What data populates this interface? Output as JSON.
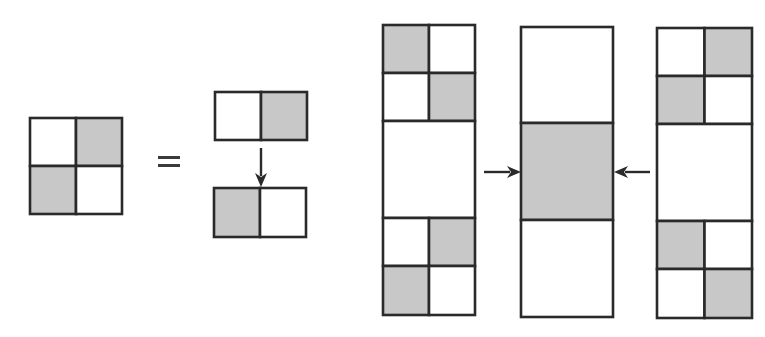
{
  "colors": {
    "shaded": "#c8c8c8",
    "blank": "#ffffff",
    "stroke": "#2a2a2a"
  },
  "figures": [
    {
      "name": "checkerboard-2x2",
      "x": 30,
      "y": 118,
      "cellW": 46,
      "cellH": 48,
      "rows": [
        [
          "blank",
          "shaded"
        ],
        [
          "shaded",
          "blank"
        ]
      ]
    },
    {
      "name": "top-pair",
      "x": 215,
      "y": 92,
      "cellW": 46,
      "cellH": 48,
      "rows": [
        [
          "blank",
          "shaded"
        ]
      ]
    },
    {
      "name": "bottom-pair",
      "x": 214,
      "y": 188,
      "cellW": 46,
      "cellH": 49,
      "rows": [
        [
          "shaded",
          "blank"
        ]
      ]
    },
    {
      "name": "left-column",
      "x": 383,
      "y": 25,
      "width": 92,
      "height": 290,
      "bands": [
        {
          "h": 48,
          "cells": [
            "shaded",
            "blank"
          ]
        },
        {
          "h": 48,
          "cells": [
            "blank",
            "shaded"
          ]
        },
        {
          "h": 97,
          "cells": [
            "blank"
          ]
        },
        {
          "h": 48,
          "cells": [
            "blank",
            "shaded"
          ]
        },
        {
          "h": 49,
          "cells": [
            "shaded",
            "blank"
          ]
        }
      ]
    },
    {
      "name": "middle-column",
      "x": 521,
      "y": 27,
      "width": 92,
      "height": 290,
      "bands": [
        {
          "h": 96,
          "cells": [
            "blank"
          ]
        },
        {
          "h": 97,
          "cells": [
            "shaded"
          ]
        },
        {
          "h": 97,
          "cells": [
            "blank"
          ]
        }
      ]
    },
    {
      "name": "right-column",
      "x": 657,
      "y": 28,
      "width": 95,
      "height": 290,
      "bands": [
        {
          "h": 48,
          "cells": [
            "blank",
            "shaded"
          ]
        },
        {
          "h": 48,
          "cells": [
            "shaded",
            "blank"
          ]
        },
        {
          "h": 97,
          "cells": [
            "blank"
          ]
        },
        {
          "h": 48,
          "cells": [
            "shaded",
            "blank"
          ]
        },
        {
          "h": 49,
          "cells": [
            "blank",
            "shaded"
          ]
        }
      ]
    }
  ],
  "equals": {
    "x": 158,
    "y": 156,
    "w": 22,
    "gap": 8
  },
  "arrows": [
    {
      "name": "down-arrow",
      "x1": 261,
      "y1": 148,
      "x2": 261,
      "y2": 187
    },
    {
      "name": "right-arrow",
      "x1": 484,
      "y1": 172,
      "x2": 521,
      "y2": 172
    },
    {
      "name": "left-arrow",
      "x1": 650,
      "y1": 172,
      "x2": 614,
      "y2": 172
    }
  ]
}
